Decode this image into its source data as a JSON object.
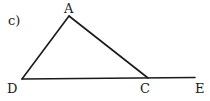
{
  "figure": {
    "part_label": "c)",
    "points": {
      "A": "A",
      "D": "D",
      "C": "C",
      "E": "E"
    },
    "segments": [
      {
        "from": "D",
        "to": "A"
      },
      {
        "from": "A",
        "to": "C"
      },
      {
        "from": "D",
        "to": "E"
      }
    ]
  }
}
